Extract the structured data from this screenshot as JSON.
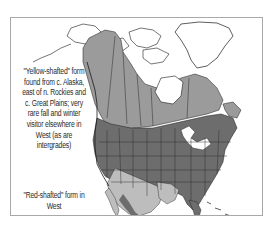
{
  "map": {
    "subject": "Northern Flicker range map, North America",
    "annotations": [
      {
        "id": "yellow-shafted",
        "text": "\"Yellow-shafted\" form found from c. Alaska, east of n. Rockies and c. Great Plains; very rare fall and winter visitor elsewhere in West (as are intergrades)"
      },
      {
        "id": "red-shafted",
        "text": "\"Red-shafted\" form in West"
      }
    ],
    "colors": {
      "breeding": "#9b9b9b",
      "year_round": "#6d6d6d",
      "winter": "#bdbdbd",
      "land_outline": "#1a1a1a",
      "frame_border": "#a8a8a8",
      "background": "#ffffff"
    }
  }
}
